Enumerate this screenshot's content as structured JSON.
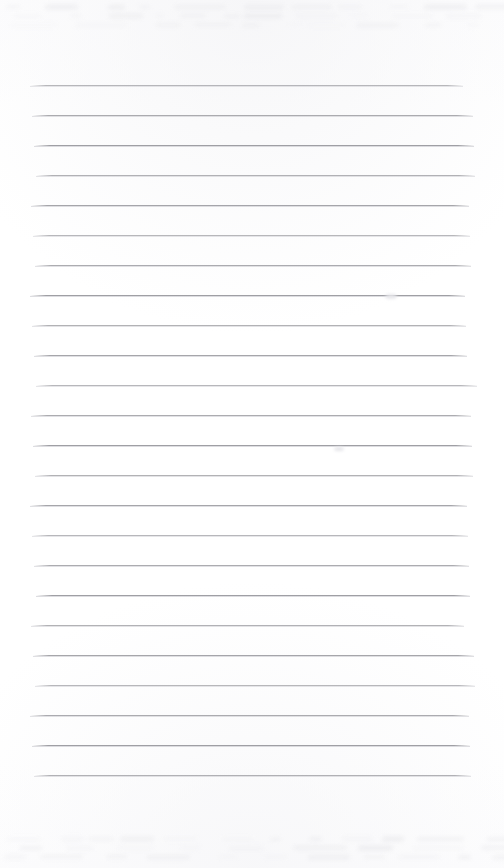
{
  "document": {
    "kind": "scanned-lined-notebook-page",
    "title": "Blank ruled notebook page",
    "page_width": 504,
    "page_height": 868,
    "background_color": "#ffffff",
    "has_text_content": false,
    "written_content": "",
    "rules": {
      "count": 24,
      "first_line_y": 85,
      "line_spacing": 30,
      "left_x": 33,
      "right_x": 470,
      "thickness": 1,
      "color": "#9a9a9f",
      "secondary_color": "#bebec4",
      "orientation": "horizontal",
      "margin_rule": "none",
      "y_positions": [
        85,
        115,
        145,
        175,
        205,
        235,
        265,
        295,
        325,
        355,
        385,
        415,
        445,
        475,
        505,
        535,
        565,
        595,
        625,
        655,
        685,
        715,
        745,
        775
      ]
    },
    "artifacts": {
      "top_ghost_band": {
        "label": "faint bleed-through marks",
        "y": 4,
        "height": 26,
        "color": "#e3e3e6"
      },
      "bottom_ghost_band": {
        "label": "faint bleed-through marks",
        "y": 836,
        "height": 26,
        "color": "#e3e3e6"
      },
      "smudges": [
        {
          "label": "smudge-upper-right",
          "x": 385,
          "y": 294,
          "w": 12,
          "h": 5
        },
        {
          "label": "smudge-mid-right",
          "x": 334,
          "y": 447,
          "w": 10,
          "h": 4
        }
      ]
    }
  }
}
